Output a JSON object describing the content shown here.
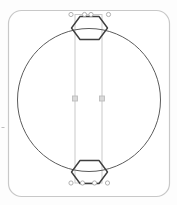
{
  "window": {
    "width": 177,
    "height": 205,
    "background": "#fdfdfd"
  },
  "scene": {
    "artboard": {
      "x": 8.5,
      "y": 10.5,
      "width": 161,
      "height": 186,
      "radius": 13,
      "stroke": "#c8c8c8",
      "stroke_width": 1.2,
      "fill": "#ffffff"
    },
    "ruler_tick": {
      "x1": 1.5,
      "y1": 127.5,
      "x2": 4.5,
      "y2": 127.5,
      "stroke": "#bdbdbd",
      "stroke_width": 1
    },
    "circle": {
      "cx": 89,
      "cy": 100,
      "r": 71.5,
      "stroke": "#5c5c5c",
      "stroke_width": 1,
      "fill": "none"
    },
    "hexagons": [
      {
        "id": "top-hexagon",
        "points": "71.5,28 80,16.5 99,16.5 107.5,28 99,39.5 80,39.5",
        "stroke": "#3e3e3e",
        "stroke_width": 1.4,
        "fill": "none"
      },
      {
        "id": "bottom-hexagon",
        "points": "71.5,172 80,160.5 99,160.5 107.5,172 99,183.5 80,183.5",
        "stroke": "#3e3e3e",
        "stroke_width": 1.4,
        "fill": "none"
      }
    ],
    "selection": {
      "rect": {
        "x": 75,
        "y": 14.5,
        "width": 27,
        "height": 168.5,
        "stroke": "#c9c9c9",
        "stroke_width": 1,
        "fill": "none"
      },
      "anchor_handle_radius": 2.1,
      "anchor_handle_stroke": "#a8a8a8",
      "anchor_handle_fill": "#ffffff",
      "anchor_points": [
        {
          "cx": 71,
          "cy": 14.5
        },
        {
          "cx": 84.5,
          "cy": 14.5
        },
        {
          "cx": 91,
          "cy": 14.5
        },
        {
          "cx": 108.5,
          "cy": 14.5
        },
        {
          "cx": 71,
          "cy": 183
        },
        {
          "cx": 82.5,
          "cy": 183
        },
        {
          "cx": 94.5,
          "cy": 183
        },
        {
          "cx": 107.5,
          "cy": 183
        }
      ],
      "midpoint_handles": [
        {
          "cx": 75,
          "cy": 98.5,
          "size": 5,
          "fill": "#d9d9d9",
          "stroke": "#bdbdbd"
        },
        {
          "cx": 102,
          "cy": 98.5,
          "size": 5,
          "fill": "#d9d9d9",
          "stroke": "#bdbdbd"
        }
      ]
    }
  }
}
